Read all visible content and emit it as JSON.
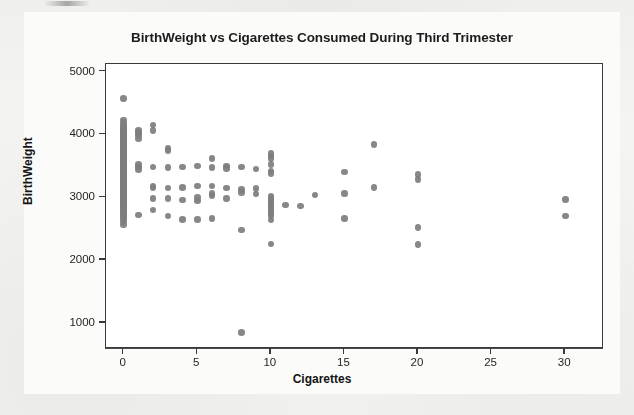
{
  "chart_data": {
    "type": "scatter",
    "title": "BirthWeight vs Cigarettes Consumed During Third Trimester",
    "xlabel": "Cigarettes",
    "ylabel": "BirthWeight",
    "xlim": [
      -1.2,
      32.5
    ],
    "ylim": [
      620,
      5120
    ],
    "xticks": [
      0,
      5,
      10,
      15,
      20,
      25,
      30
    ],
    "yticks": [
      1000,
      2000,
      3000,
      4000,
      5000
    ],
    "grid": false,
    "legend": null,
    "marker_color": "#7d7d7d",
    "frame_color": "#3a3a3a",
    "plot_background": "#ffffff",
    "page_background": "#f2f2f1",
    "points": [
      [
        0,
        4570
      ],
      [
        0,
        4230
      ],
      [
        0,
        4180
      ],
      [
        0,
        4140
      ],
      [
        0,
        4100
      ],
      [
        0,
        4080
      ],
      [
        0,
        4060
      ],
      [
        0,
        4040
      ],
      [
        0,
        4020
      ],
      [
        0,
        4000
      ],
      [
        0,
        3980
      ],
      [
        0,
        3960
      ],
      [
        0,
        3940
      ],
      [
        0,
        3920
      ],
      [
        0,
        3900
      ],
      [
        0,
        3880
      ],
      [
        0,
        3860
      ],
      [
        0,
        3840
      ],
      [
        0,
        3820
      ],
      [
        0,
        3800
      ],
      [
        0,
        3780
      ],
      [
        0,
        3760
      ],
      [
        0,
        3740
      ],
      [
        0,
        3720
      ],
      [
        0,
        3700
      ],
      [
        0,
        3680
      ],
      [
        0,
        3660
      ],
      [
        0,
        3640
      ],
      [
        0,
        3620
      ],
      [
        0,
        3600
      ],
      [
        0,
        3580
      ],
      [
        0,
        3560
      ],
      [
        0,
        3540
      ],
      [
        0,
        3520
      ],
      [
        0,
        3500
      ],
      [
        0,
        3480
      ],
      [
        0,
        3460
      ],
      [
        0,
        3440
      ],
      [
        0,
        3420
      ],
      [
        0,
        3400
      ],
      [
        0,
        3380
      ],
      [
        0,
        3360
      ],
      [
        0,
        3340
      ],
      [
        0,
        3320
      ],
      [
        0,
        3300
      ],
      [
        0,
        3280
      ],
      [
        0,
        3260
      ],
      [
        0,
        3240
      ],
      [
        0,
        3220
      ],
      [
        0,
        3200
      ],
      [
        0,
        3180
      ],
      [
        0,
        3160
      ],
      [
        0,
        3140
      ],
      [
        0,
        3120
      ],
      [
        0,
        3100
      ],
      [
        0,
        3080
      ],
      [
        0,
        3060
      ],
      [
        0,
        3040
      ],
      [
        0,
        3020
      ],
      [
        0,
        3000
      ],
      [
        0,
        2980
      ],
      [
        0,
        2960
      ],
      [
        0,
        2940
      ],
      [
        0,
        2920
      ],
      [
        0,
        2900
      ],
      [
        0,
        2880
      ],
      [
        0,
        2860
      ],
      [
        0,
        2840
      ],
      [
        0,
        2820
      ],
      [
        0,
        2800
      ],
      [
        0,
        2780
      ],
      [
        0,
        2760
      ],
      [
        0,
        2730
      ],
      [
        0,
        2700
      ],
      [
        0,
        2660
      ],
      [
        0,
        2620
      ],
      [
        0,
        2560
      ],
      [
        1,
        4060
      ],
      [
        1,
        4030
      ],
      [
        1,
        3990
      ],
      [
        1,
        3940
      ],
      [
        1,
        3520
      ],
      [
        1,
        3480
      ],
      [
        1,
        3440
      ],
      [
        1,
        2720
      ],
      [
        2,
        4150
      ],
      [
        2,
        4060
      ],
      [
        2,
        3480
      ],
      [
        2,
        3180
      ],
      [
        2,
        3150
      ],
      [
        2,
        2980
      ],
      [
        2,
        2800
      ],
      [
        3,
        3780
      ],
      [
        3,
        3740
      ],
      [
        3,
        3470
      ],
      [
        3,
        3150
      ],
      [
        3,
        2980
      ],
      [
        3,
        2700
      ],
      [
        4,
        3480
      ],
      [
        4,
        3160
      ],
      [
        4,
        2960
      ],
      [
        4,
        2650
      ],
      [
        5,
        3500
      ],
      [
        5,
        3180
      ],
      [
        5,
        3000
      ],
      [
        5,
        2940
      ],
      [
        5,
        2650
      ],
      [
        6,
        3620
      ],
      [
        6,
        3470
      ],
      [
        6,
        3180
      ],
      [
        6,
        3060
      ],
      [
        6,
        3020
      ],
      [
        6,
        2660
      ],
      [
        7,
        3500
      ],
      [
        7,
        3460
      ],
      [
        7,
        3150
      ],
      [
        7,
        2980
      ],
      [
        8,
        3480
      ],
      [
        8,
        3120
      ],
      [
        8,
        3080
      ],
      [
        8,
        2480
      ],
      [
        8,
        850
      ],
      [
        9,
        3450
      ],
      [
        9,
        3140
      ],
      [
        9,
        3050
      ],
      [
        10,
        3700
      ],
      [
        10,
        3660
      ],
      [
        10,
        3620
      ],
      [
        10,
        3520
      ],
      [
        10,
        3420
      ],
      [
        10,
        3380
      ],
      [
        10,
        3020
      ],
      [
        10,
        2980
      ],
      [
        10,
        2940
      ],
      [
        10,
        2900
      ],
      [
        10,
        2860
      ],
      [
        10,
        2820
      ],
      [
        10,
        2780
      ],
      [
        10,
        2740
      ],
      [
        10,
        2700
      ],
      [
        10,
        2640
      ],
      [
        10,
        2260
      ],
      [
        11,
        2880
      ],
      [
        12,
        2860
      ],
      [
        13,
        3040
      ],
      [
        15,
        3400
      ],
      [
        15,
        3060
      ],
      [
        15,
        2660
      ],
      [
        17,
        3840
      ],
      [
        17,
        3160
      ],
      [
        20,
        3360
      ],
      [
        20,
        3280
      ],
      [
        20,
        2520
      ],
      [
        20,
        2250
      ],
      [
        30,
        2970
      ],
      [
        30,
        2700
      ]
    ]
  }
}
